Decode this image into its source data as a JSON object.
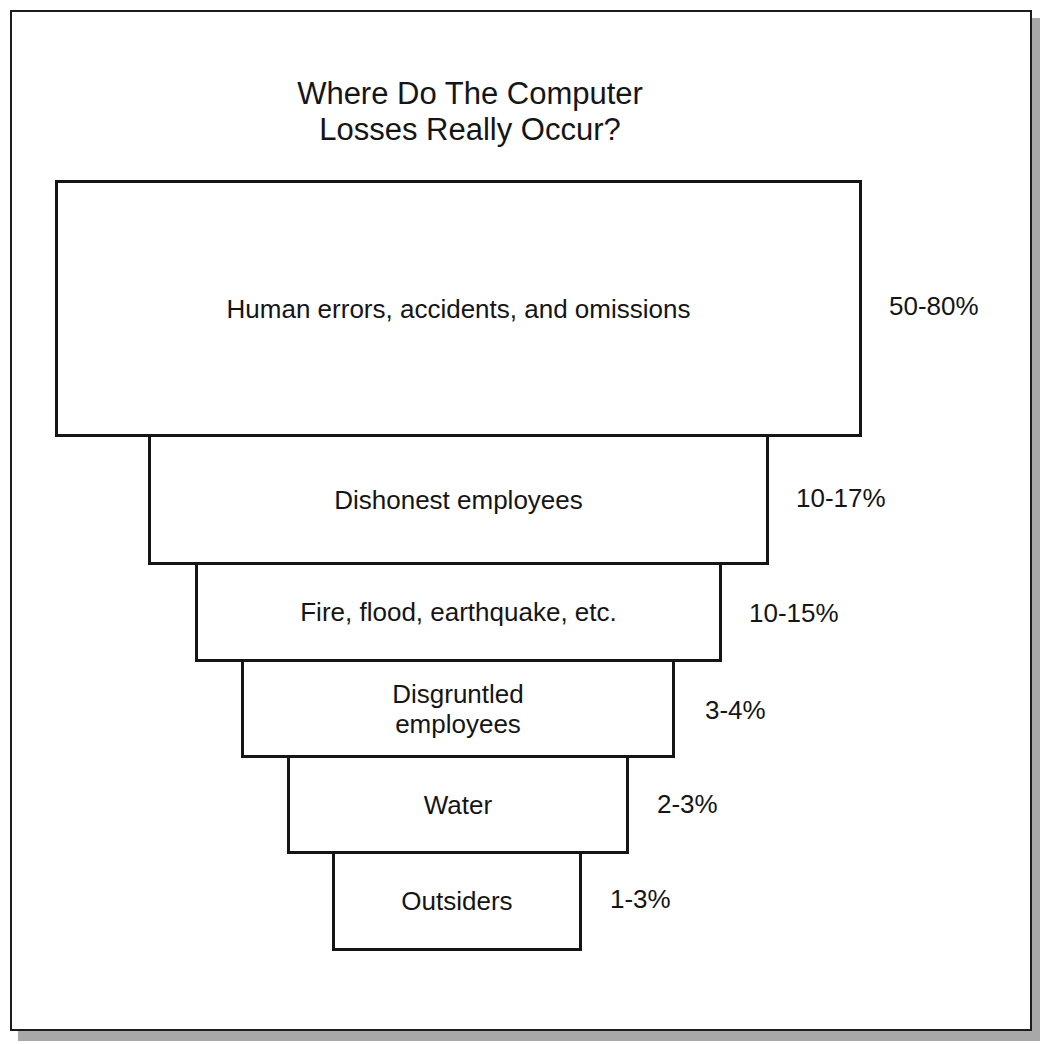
{
  "figure": {
    "title_lines": [
      "Where Do The Computer",
      "Losses Really Occur?"
    ],
    "levels": [
      {
        "label": "Human errors, accidents, and omissions",
        "percent": "50-80%"
      },
      {
        "label": "Dishonest employees",
        "percent": "10-17%"
      },
      {
        "label": "Fire, flood, earthquake, etc.",
        "percent": "10-15%"
      },
      {
        "label_lines": [
          "Disgruntled",
          "employees"
        ],
        "percent": "3-4%"
      },
      {
        "label": "Water",
        "percent": "2-3%"
      },
      {
        "label": "Outsiders",
        "percent": "1-3%"
      }
    ],
    "colors": {
      "stroke": "#151515",
      "background": "#ffffff",
      "shadow": "#a8a8a8"
    }
  }
}
